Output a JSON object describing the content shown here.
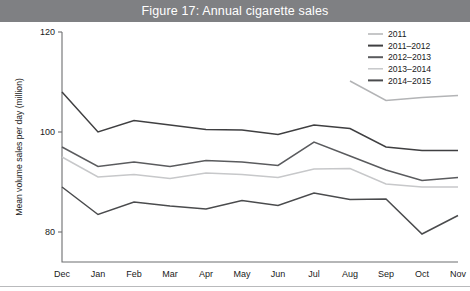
{
  "figure": {
    "title": "Figure 17: Annual cigarette sales",
    "title_bar_color": "#7f8083",
    "title_text_color": "#ffffff"
  },
  "chart_data": {
    "type": "line",
    "title": "Figure 17: Annual cigarette sales",
    "xlabel": "",
    "ylabel": "Mean volume sales per day (million)",
    "categories": [
      "Dec",
      "Jan",
      "Feb",
      "Mar",
      "Apr",
      "May",
      "Jun",
      "Jul",
      "Aug",
      "Sep",
      "Oct",
      "Nov"
    ],
    "ylim": [
      74,
      120
    ],
    "yticks": [
      80,
      100,
      120
    ],
    "ytick_labels": [
      "80",
      "100",
      "120"
    ],
    "grid": false,
    "legend_position": "top-right",
    "series": [
      {
        "name": "2011",
        "color": "#b3b4b6",
        "width": 1.5,
        "values": [
          null,
          null,
          null,
          null,
          null,
          null,
          null,
          null,
          110.2,
          106.3,
          106.9,
          107.3
        ]
      },
      {
        "name": "2011–2012",
        "color": "#3f3f41",
        "width": 1.5,
        "values": [
          108.0,
          100.0,
          102.3,
          101.4,
          100.5,
          100.4,
          99.5,
          101.4,
          100.7,
          97.0,
          96.3,
          96.3
        ]
      },
      {
        "name": "2012–2013",
        "color": "#5a5b5e",
        "width": 1.5,
        "values": [
          97.0,
          93.1,
          94.0,
          93.1,
          94.3,
          94.0,
          93.3,
          98.0,
          95.2,
          92.4,
          90.3,
          90.9
        ]
      },
      {
        "name": "2013–2014",
        "color": "#c7c8ca",
        "width": 1.5,
        "values": [
          95.0,
          91.0,
          91.5,
          90.7,
          91.8,
          91.5,
          90.9,
          92.6,
          92.7,
          89.6,
          89.0,
          89.0
        ]
      },
      {
        "name": "2014–2015",
        "color": "#4a4b4d",
        "width": 1.5,
        "values": [
          89.0,
          83.5,
          86.0,
          85.2,
          84.6,
          86.3,
          85.3,
          87.8,
          86.5,
          86.6,
          79.6,
          83.3
        ]
      }
    ]
  },
  "legend": {
    "items": [
      {
        "label": "2011",
        "color": "#b3b4b6"
      },
      {
        "label": "2011–2012",
        "color": "#3f3f41"
      },
      {
        "label": "2012–2013",
        "color": "#5a5b5e"
      },
      {
        "label": "2013–2014",
        "color": "#c7c8ca"
      },
      {
        "label": "2014–2015",
        "color": "#4a4b4d"
      }
    ]
  }
}
